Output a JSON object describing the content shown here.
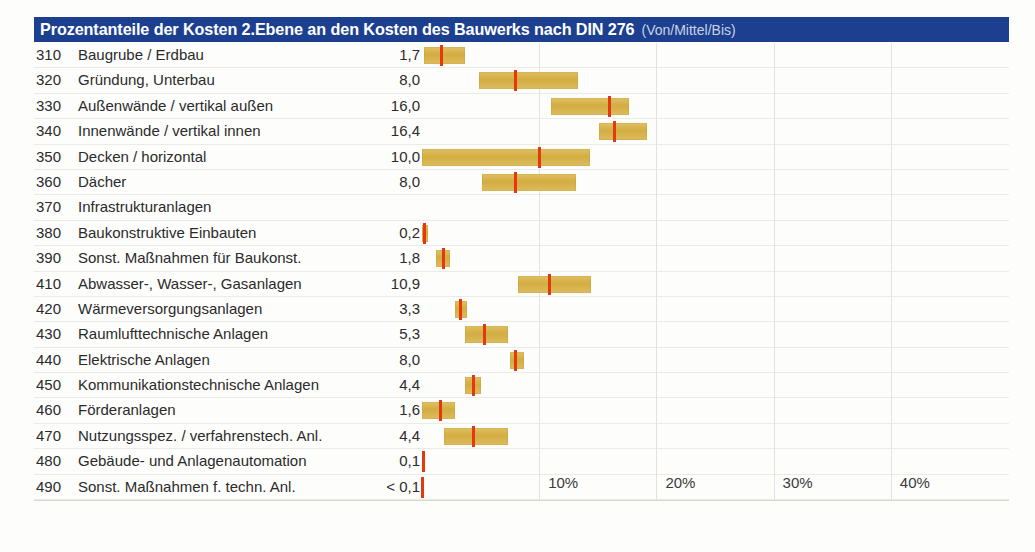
{
  "header": {
    "title": "Prozentanteile der Kosten 2.Ebene an den Kosten des Bauwerks nach DIN 276",
    "subtitle": "(Von/Mittel/Bis)",
    "bar_color": "#1c3f8f",
    "title_color": "#ffffff"
  },
  "colors": {
    "bar": "#d3ad42",
    "marker": "#e4380e",
    "grid": "#e4e2dc",
    "text": "#2b2b2b"
  },
  "axis": {
    "ticks": [
      "10%",
      "20%",
      "30%",
      "40%"
    ],
    "tick_values": [
      10,
      20,
      30,
      40
    ],
    "min": 0,
    "max": 45
  },
  "chart_data": {
    "type": "bar",
    "title": "Prozentanteile der Kosten 2.Ebene an den Kosten des Bauwerks nach DIN 276",
    "subtitle": "(Von/Mittel/Bis)",
    "xlabel": "",
    "ylabel": "",
    "xlim": [
      0,
      45
    ],
    "grid": true,
    "legend": "none",
    "columns": [
      "Code",
      "Bezeichnung",
      "Mittel",
      "Von",
      "Bis"
    ],
    "rows": [
      {
        "code": "310",
        "label": "Baugrube / Erdbau",
        "value": "1,7",
        "mean": 1.7,
        "from": 0.2,
        "to": 3.7
      },
      {
        "code": "320",
        "label": "Gründung, Unterbau",
        "value": "8,0",
        "mean": 8.0,
        "from": 4.9,
        "to": 13.3
      },
      {
        "code": "330",
        "label": "Außenwände / vertikal außen",
        "value": "16,0",
        "mean": 16.0,
        "from": 11.0,
        "to": 17.7
      },
      {
        "code": "340",
        "label": "Innenwände / vertikal innen",
        "value": "16,4",
        "mean": 16.4,
        "from": 15.1,
        "to": 19.2
      },
      {
        "code": "350",
        "label": "Decken / horizontal",
        "value": "10,0",
        "mean": 10.0,
        "from": 0.0,
        "to": 14.3
      },
      {
        "code": "360",
        "label": "Dächer",
        "value": "8,0",
        "mean": 8.0,
        "from": 5.1,
        "to": 13.1
      },
      {
        "code": "370",
        "label": "Infrastrukturanlagen",
        "value": "",
        "mean": null,
        "from": null,
        "to": null
      },
      {
        "code": "380",
        "label": "Baukonstruktive Einbauten",
        "value": "0,2",
        "mean": 0.2,
        "from": 0.0,
        "to": 0.5
      },
      {
        "code": "390",
        "label": "Sonst. Maßnahmen für Baukonst.",
        "value": "1,8",
        "mean": 1.8,
        "from": 1.2,
        "to": 2.4
      },
      {
        "code": "410",
        "label": "Abwasser-, Wasser-, Gasanlagen",
        "value": "10,9",
        "mean": 10.9,
        "from": 8.2,
        "to": 14.4
      },
      {
        "code": "420",
        "label": "Wärmeversorgungsanlagen",
        "value": "3,3",
        "mean": 3.3,
        "from": 2.8,
        "to": 3.8
      },
      {
        "code": "430",
        "label": "Raumlufttechnische Anlagen",
        "value": "5,3",
        "mean": 5.3,
        "from": 3.7,
        "to": 7.3
      },
      {
        "code": "440",
        "label": "Elektrische Anlagen",
        "value": "8,0",
        "mean": 8.0,
        "from": 7.5,
        "to": 8.7
      },
      {
        "code": "450",
        "label": "Kommunikationstechnische Anlagen",
        "value": "4,4",
        "mean": 4.4,
        "from": 3.7,
        "to": 5.0
      },
      {
        "code": "460",
        "label": "Förderanlagen",
        "value": "1,6",
        "mean": 1.6,
        "from": 0.0,
        "to": 2.8
      },
      {
        "code": "470",
        "label": "Nutzungsspez. / verfahrenstech. Anl.",
        "value": "4,4",
        "mean": 4.4,
        "from": 1.9,
        "to": 7.3
      },
      {
        "code": "480",
        "label": "Gebäude- und Anlagenautomation",
        "value": "0,1",
        "mean": 0.1,
        "from": 0.0,
        "to": 0.2
      },
      {
        "code": "490",
        "label": "Sonst. Maßnahmen f. techn. Anl.",
        "value": "< 0,1",
        "mean": 0.05,
        "from": 0.0,
        "to": 0.1
      }
    ]
  }
}
